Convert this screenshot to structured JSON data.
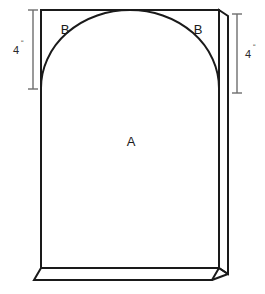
{
  "figure": {
    "background_color": "#ffffff",
    "outline_color": "#1a1a1a",
    "face_fill": "#ffffff"
  },
  "labels": {
    "region_a": "A",
    "region_b_left": "B",
    "region_b_right": "B"
  },
  "dimensions": {
    "left": {
      "value": "4",
      "unit": "ʺ",
      "orientation": "vertical",
      "measures": "arch rise"
    },
    "right": {
      "value": "4",
      "unit": "ʺ",
      "orientation": "vertical",
      "measures": "arch rise"
    }
  },
  "geometry": {
    "front_face": {
      "left_x": 41,
      "right_x": 219,
      "top_y": 10,
      "bottom_y": 268
    },
    "depth_offset": {
      "dx": 9,
      "dy": 6
    },
    "arch": {
      "spring_y": 88,
      "apex_y": 12,
      "left_x": 41,
      "right_x": 219
    },
    "dimension_lines": {
      "left_x": 33,
      "right_x": 237,
      "top_y": 10,
      "bottom_y": 89,
      "cap_half_width": 5
    }
  }
}
